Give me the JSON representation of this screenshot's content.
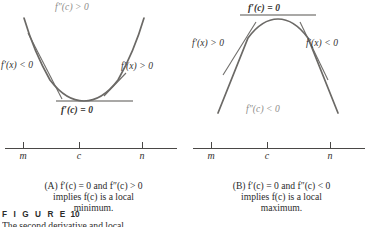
{
  "figure": {
    "number_label": "F I G U R E",
    "number": "10",
    "subtitle": "The second derivative and local"
  },
  "panels": [
    {
      "id": "A",
      "type": "local-minimum",
      "curve": "upward-parabola",
      "labels": {
        "top": "f″(c) > 0",
        "left": "f′(x) < 0",
        "right": "f′(x) > 0",
        "bottom": "f′(c) = 0"
      },
      "numberline": {
        "left": "m",
        "center": "c",
        "right": "n"
      },
      "caption": [
        "(A) f′(c)  =  0 and f″(c) > 0",
        "implies f(c) is a local",
        "minimum."
      ]
    },
    {
      "id": "B",
      "type": "local-maximum",
      "curve": "downward-parabola",
      "labels": {
        "top": "f′(c) = 0",
        "left": "f′(x) > 0",
        "right": "f′(x) < 0",
        "bottom": "f″(c) < 0"
      },
      "numberline": {
        "left": "m",
        "center": "c",
        "right": "n"
      },
      "caption": [
        "(B) f′(c)  =  0 and f″(c) < 0",
        "implies f(c) is a local",
        "maximum."
      ]
    }
  ],
  "colors": {
    "curve": "#6b6966",
    "tangent": "#55534f",
    "axis": "#4a4846",
    "text": "#2b2b2b",
    "muted_text": "#8d8b89",
    "background": "#ffffff"
  }
}
